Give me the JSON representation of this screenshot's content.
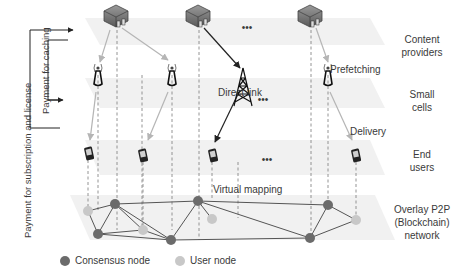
{
  "layers": {
    "content_providers": "Content providers",
    "small_cells": "Small cells",
    "end_users": "End users",
    "overlay": "Overlay P2P (Blockchain) network"
  },
  "layer_lines": {
    "content_providers": [
      "Content",
      "providers"
    ],
    "small_cells": [
      "Small",
      "cells"
    ],
    "end_users": [
      "End",
      "users"
    ],
    "overlay": [
      "Overlay P2P",
      "(Blockchain)",
      "network"
    ]
  },
  "annotations": {
    "direct_link": "Direct link",
    "prefetching": "Prefetching",
    "delivery": "Delivery",
    "virtual_mapping": "Virtual mapping",
    "ellipsis": "•••"
  },
  "payments": {
    "subscription": "Payment for subscription and license",
    "caching": "Payment for caching"
  },
  "legend": {
    "consensus": {
      "label": "Consensus node",
      "color": "#6b6b6b"
    },
    "user": {
      "label": "User node",
      "color": "#c8c8c8"
    }
  },
  "colors": {
    "plane": "#f1f1f1",
    "gray_link": "#b5b5b5",
    "black_link": "#222222",
    "dashed": "#888888",
    "net_edge": "#555555"
  }
}
